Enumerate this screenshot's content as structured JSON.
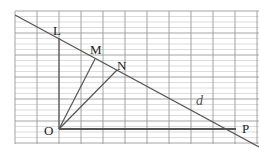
{
  "diagram": {
    "type": "geometry-on-grid",
    "grid": {
      "x0": 15,
      "x1": 259,
      "y0": 11,
      "y1": 144,
      "major_spacing": 22,
      "minor_spacing": 5.5,
      "color_major": "#9a9a9a",
      "color_minor": "#cfcfcf"
    },
    "points": {
      "O": {
        "label": "O",
        "x": 59,
        "y": 129
      },
      "P": {
        "label": "P",
        "x": 236,
        "y": 129
      },
      "L": {
        "label": "L",
        "x": 59,
        "y": 38
      },
      "M": {
        "label": "M",
        "x": 95,
        "y": 59
      },
      "N": {
        "label": "N",
        "x": 117,
        "y": 70
      }
    },
    "line_label": "d",
    "segments": [
      {
        "name": "line-d",
        "from": [
          15,
          15
        ],
        "to": [
          259,
          147
        ]
      },
      {
        "name": "segment-OL",
        "from": [
          59,
          129
        ],
        "to": [
          59,
          38
        ]
      },
      {
        "name": "segment-OP",
        "from": [
          59,
          129
        ],
        "to": [
          236,
          129
        ]
      },
      {
        "name": "segment-OM",
        "from": [
          59,
          129
        ],
        "to": [
          95,
          59
        ]
      },
      {
        "name": "segment-ON",
        "from": [
          59,
          129
        ],
        "to": [
          117,
          70
        ]
      }
    ],
    "colors": {
      "line": "#555555",
      "text": "#222222"
    }
  }
}
